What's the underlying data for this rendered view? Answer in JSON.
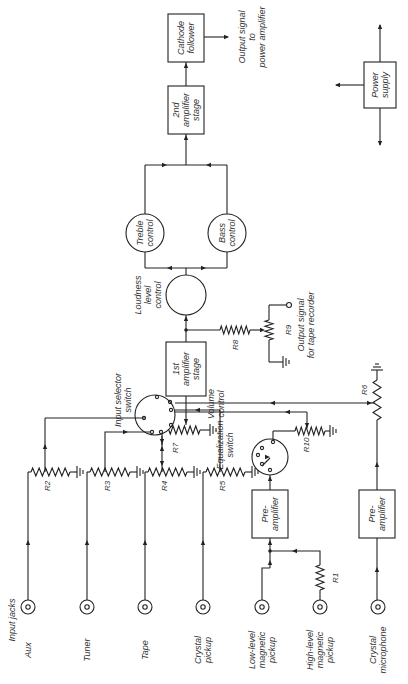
{
  "diagram": {
    "type": "block-schematic",
    "orientation": "rotated -90°",
    "blocks": {
      "cathode_follower": [
        "Cathode",
        "follower"
      ],
      "second_amp": [
        "2nd",
        "amplifier",
        "stage"
      ],
      "treble": [
        "Treble",
        "control"
      ],
      "bass": [
        "Bass",
        "control"
      ],
      "loudness": [
        "Loudness",
        "level",
        "control"
      ],
      "first_amp": [
        "1st",
        "amplifier",
        "stage"
      ],
      "preamp_mag": [
        "Pre-",
        "amplifier"
      ],
      "preamp_mic": [
        "Pre-",
        "amplifier"
      ],
      "power_supply": [
        "Power",
        "supply"
      ]
    },
    "labels": {
      "output_power": [
        "Output signal",
        "to",
        "power amplifier"
      ],
      "output_tape": [
        "Output signal",
        "for tape recorder"
      ],
      "input_selector": [
        "Input selector",
        "switch"
      ],
      "volume": [
        "Volume",
        "control"
      ],
      "equalization": [
        "Equalization",
        "switch"
      ],
      "input_jacks": "Input jacks"
    },
    "resistors": {
      "r1": "R1",
      "r2": "R2",
      "r3": "R3",
      "r4": "R4",
      "r5": "R5",
      "r6": "R6",
      "r7": "R7",
      "r8": "R8",
      "r9": "R9",
      "r10": "R10"
    },
    "jacks": [
      {
        "label": [
          "Aux"
        ]
      },
      {
        "label": [
          "Tuner"
        ]
      },
      {
        "label": [
          "Tape"
        ]
      },
      {
        "label": [
          "Crystal",
          "pickup"
        ]
      },
      {
        "label": [
          "Low-level",
          "magnetic",
          "pickup"
        ]
      },
      {
        "label": [
          "High-level",
          "magnetic",
          "pickup"
        ]
      },
      {
        "label": [
          "Crystal",
          "microphone"
        ]
      }
    ]
  }
}
